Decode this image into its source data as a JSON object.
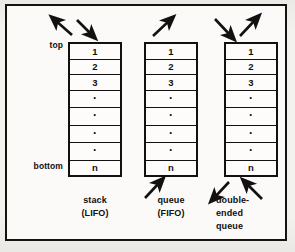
{
  "figure": {
    "frame_color": "#16130f",
    "ink_color": "#101010",
    "paper_color": "#f4f2ef"
  },
  "row_labels": {
    "top": "top",
    "bottom": "bottom"
  },
  "cells": [
    "1",
    "2",
    "3",
    "·",
    "·",
    "·",
    "·",
    "n"
  ],
  "structures": [
    {
      "id": "stack",
      "caption_line1": "stack",
      "caption_line2": "(LIFO)",
      "cells": [
        "1",
        "2",
        "3",
        "·",
        "·",
        "·",
        "·",
        "n"
      ],
      "arrows": [
        {
          "name": "stack-pop-arrow",
          "direction": "up-left",
          "position": "top",
          "meaning": "out"
        },
        {
          "name": "stack-push-arrow",
          "direction": "down-left",
          "position": "top",
          "meaning": "in"
        }
      ]
    },
    {
      "id": "queue",
      "caption_line1": "queue",
      "caption_line2": "(FIFO)",
      "cells": [
        "1",
        "2",
        "3",
        "·",
        "·",
        "·",
        "·",
        "n"
      ],
      "arrows": [
        {
          "name": "queue-dequeue-arrow",
          "direction": "up-right",
          "position": "top",
          "meaning": "out"
        },
        {
          "name": "queue-enqueue-arrow",
          "direction": "up-right",
          "position": "bottom",
          "meaning": "in"
        }
      ]
    },
    {
      "id": "deque",
      "caption_line1": "double-",
      "caption_line2": "ended",
      "caption_line3": "queue",
      "cells": [
        "1",
        "2",
        "3",
        "·",
        "·",
        "·",
        "·",
        "n"
      ],
      "arrows": [
        {
          "name": "deque-top-in-arrow",
          "direction": "down-right",
          "position": "top",
          "meaning": "in"
        },
        {
          "name": "deque-top-out-arrow",
          "direction": "up-right",
          "position": "top",
          "meaning": "out"
        },
        {
          "name": "deque-bottom-out-arrow",
          "direction": "down-left",
          "position": "bottom",
          "meaning": "out"
        },
        {
          "name": "deque-bottom-in-arrow",
          "direction": "up-left",
          "position": "bottom",
          "meaning": "in"
        }
      ]
    }
  ]
}
